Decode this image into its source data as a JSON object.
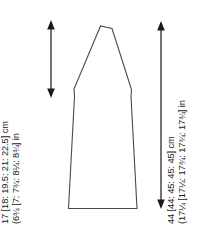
{
  "diagram": {
    "type": "garment-schematic",
    "piece": "sleeve",
    "stroke_color": "#4a4a4a",
    "background_color": "#ffffff",
    "measurements": {
      "sleeve_cap": {
        "cm_line": "17 [18: 19.5: 21: 22.5] cm",
        "in_line": "(6¾ [7: 7¾: 8¼: 8¾] in",
        "unit_cm": "cm",
        "unit_in": "in",
        "cm_values": [
          17,
          18,
          19.5,
          21,
          22.5
        ],
        "in_values": [
          "6¾",
          "7",
          "7¾",
          "8¼",
          "8¾"
        ],
        "arrow": "double-headed-vertical"
      },
      "sleeve_length": {
        "cm_line": "44 [44: 45: 45: 45] cm",
        "in_line": "(17¼ [17¼: 17¾: 17¾: 17¾] in",
        "unit_cm": "cm",
        "unit_in": "in",
        "cm_values": [
          44,
          44,
          45,
          45,
          45
        ],
        "in_values": [
          "17¼",
          "17¼",
          "17¾",
          "17¾",
          "17¾"
        ],
        "arrow": "double-headed-vertical"
      }
    }
  }
}
